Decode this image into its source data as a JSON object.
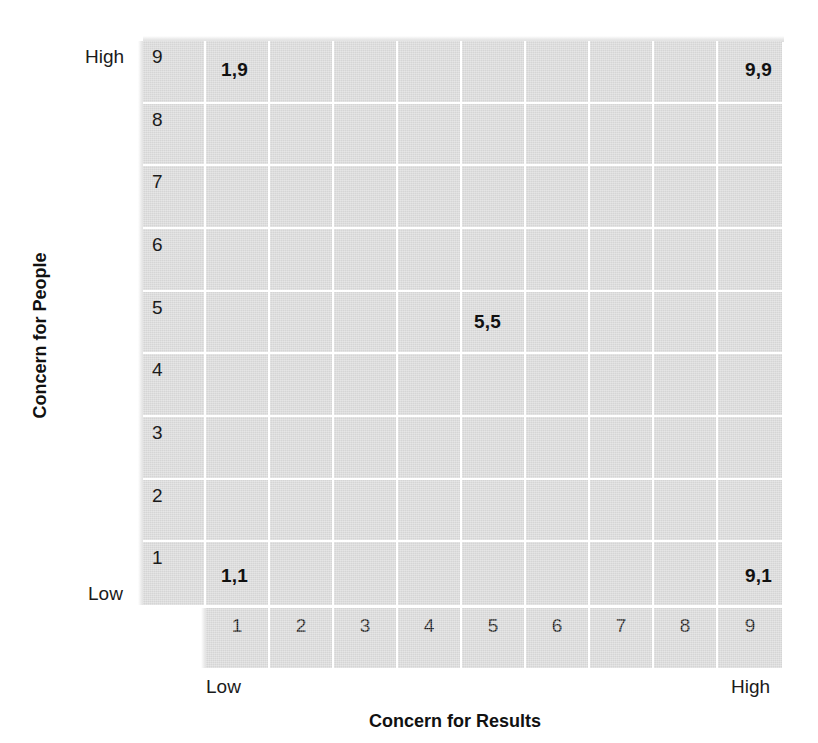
{
  "chart_data": {
    "type": "table",
    "title": "",
    "subtitle": "",
    "xlabel": "Concern for Results",
    "ylabel": "Concern for People",
    "x_ticks": [
      "1",
      "2",
      "3",
      "4",
      "5",
      "6",
      "7",
      "8",
      "9"
    ],
    "y_ticks": [
      "9",
      "8",
      "7",
      "6",
      "5",
      "4",
      "3",
      "2",
      "1"
    ],
    "xlim": [
      1,
      9
    ],
    "ylim": [
      1,
      9
    ],
    "x_low_label": "Low",
    "x_high_label": "High",
    "y_low_label": "Low",
    "y_high_label": "High",
    "grid": true,
    "legend": "none",
    "cell_fill_color": "#d5d5d5",
    "gridline_color": "#ffffff",
    "text_color": "#111111",
    "annotations": [
      {
        "label": "1,9",
        "x": 1,
        "y": 9,
        "align": "left"
      },
      {
        "label": "9,9",
        "x": 9,
        "y": 9,
        "align": "right"
      },
      {
        "label": "5,5",
        "x": 5,
        "y": 5,
        "align": "left"
      },
      {
        "label": "1,1",
        "x": 1,
        "y": 1,
        "align": "left"
      },
      {
        "label": "9,1",
        "x": 9,
        "y": 1,
        "align": "right"
      }
    ]
  },
  "axes": {
    "x_title": "Concern for Results",
    "y_title": "Concern for People",
    "y_high": "High",
    "y_low": "Low",
    "x_low": "Low",
    "x_high": "High"
  },
  "y_numbers": [
    "9",
    "8",
    "7",
    "6",
    "5",
    "4",
    "3",
    "2",
    "1"
  ],
  "x_numbers": [
    "1",
    "2",
    "3",
    "4",
    "5",
    "6",
    "7",
    "8",
    "9"
  ],
  "points": {
    "p19": "1,9",
    "p99": "9,9",
    "p55": "5,5",
    "p11": "1,1",
    "p91": "9,1"
  }
}
